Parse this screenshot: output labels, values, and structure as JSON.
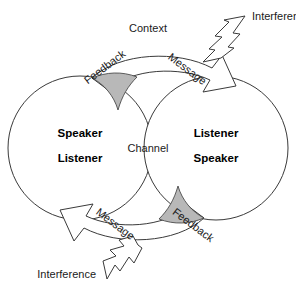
{
  "diagram": {
    "type": "communication-model",
    "background_color": "#ffffff",
    "line_color": "#3a3a3a",
    "shade_color": "#b8b8b8",
    "text_color": "#1a1a1a"
  },
  "context": {
    "label": "Context"
  },
  "channel": {
    "label": "Channel"
  },
  "left_participant": {
    "role_primary": "Speaker",
    "role_secondary": "Listener"
  },
  "right_participant": {
    "role_primary": "Listener",
    "role_secondary": "Speaker"
  },
  "flows": {
    "top_message": "Message",
    "top_feedback": "Feedback",
    "bottom_message": "Message",
    "bottom_feedback": "Feedback"
  },
  "interference": {
    "top_label": "Interference",
    "bottom_label": "Interference"
  }
}
